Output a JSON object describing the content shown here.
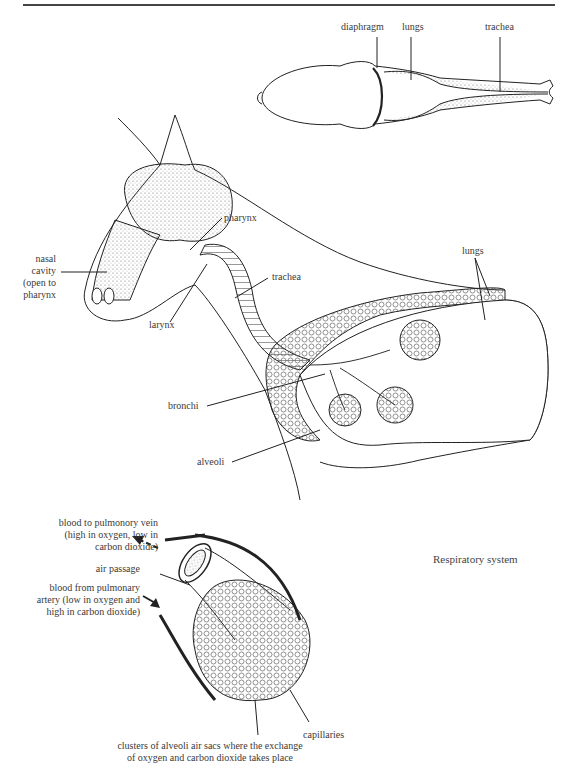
{
  "figure": {
    "caption": "Respiratory system",
    "top_view": {
      "labels": {
        "diaphragm": "diaphragm",
        "lungs": "lungs",
        "trachea": "trachea"
      }
    },
    "side_view": {
      "labels": {
        "nasal_cavity": [
          "nasal",
          "cavity",
          "(open to",
          "pharynx"
        ],
        "pharynx": "pharynx",
        "larynx": "larynx",
        "trachea": "trachea",
        "lungs": "lungs",
        "bronchi": "bronchi",
        "alveoli": "alveoli"
      }
    },
    "alveoli_detail": {
      "labels": {
        "blood_to_vein": [
          "blood to pulmonory vein",
          "(high in oxygen, low in",
          "carbon dioxide)"
        ],
        "air_passage": "air passage",
        "blood_from_artery": [
          "blood from pulmonary",
          "artery (low in oxygen and",
          "high in carbon dioxide)"
        ],
        "capillaries": "capillaries",
        "clusters": [
          "clusters of alveoli air sacs where the exchange",
          "of oxygen and carbon dioxide takes place"
        ]
      }
    }
  }
}
